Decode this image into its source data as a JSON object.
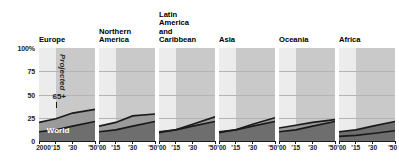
{
  "chart_data": {
    "type": "area",
    "title": "",
    "xlabel": "",
    "ylabel": "",
    "ylim": [
      0,
      100
    ],
    "xlim": [
      2000,
      2050
    ],
    "grid": true,
    "legend_position": "inline-annotations",
    "y_ticks": [
      {
        "value": 100,
        "label": "100%"
      },
      {
        "value": 75,
        "label": "75"
      },
      {
        "value": 50,
        "label": "50"
      },
      {
        "value": 25,
        "label": "25"
      },
      {
        "value": 0,
        "label": "0"
      }
    ],
    "x_ticks_first_panel": [
      "2000",
      "'15",
      "'30",
      "'50"
    ],
    "x_ticks": [
      "'00",
      "'15",
      "'30",
      "'50"
    ],
    "x_tick_values": [
      2000,
      2015,
      2030,
      2050
    ],
    "projection_start_year": 2015,
    "annotations": [
      {
        "name": "projected",
        "text": "Projected"
      },
      {
        "name": "series-65plus",
        "text": "65+"
      },
      {
        "name": "series-world",
        "text": "World"
      }
    ],
    "x": [
      2000,
      2015,
      2030,
      2050
    ],
    "panels": [
      {
        "name": "europe",
        "title": "Europe",
        "series": [
          {
            "name": "65+",
            "values": [
              20,
              24,
              30,
              34
            ]
          },
          {
            "name": "World",
            "values": [
              10,
              12,
              16,
              21
            ]
          }
        ]
      },
      {
        "name": "northern-america",
        "title": "Northern\nAmerica",
        "series": [
          {
            "name": "65+",
            "values": [
              16,
              20,
              27,
              29
            ]
          },
          {
            "name": "World",
            "values": [
              10,
              12,
              16,
              21
            ]
          }
        ]
      },
      {
        "name": "latin-america-and-caribbean",
        "title": "Latin\nAmerica\nand\nCaribbean",
        "series": [
          {
            "name": "65+",
            "values": [
              9,
              12,
              18,
              26
            ]
          },
          {
            "name": "World",
            "values": [
              10,
              12,
              16,
              21
            ]
          }
        ]
      },
      {
        "name": "asia",
        "title": "Asia",
        "series": [
          {
            "name": "65+",
            "values": [
              9,
              12,
              18,
              25
            ]
          },
          {
            "name": "World",
            "values": [
              10,
              12,
              16,
              21
            ]
          }
        ]
      },
      {
        "name": "oceania",
        "title": "Oceania",
        "series": [
          {
            "name": "65+",
            "values": [
              14,
              17,
              20,
              23
            ]
          },
          {
            "name": "World",
            "values": [
              10,
              12,
              16,
              21
            ]
          }
        ]
      },
      {
        "name": "africa",
        "title": "Africa",
        "series": [
          {
            "name": "65+",
            "values": [
              5,
              6,
              8,
              11
            ]
          },
          {
            "name": "World",
            "values": [
              10,
              12,
              16,
              21
            ]
          }
        ]
      }
    ],
    "colors": {
      "historical_background": "#ececec",
      "projected_background": "#c9c9c9",
      "gridline": "#b4b4b4",
      "band_65plus": "#9a9a9a",
      "band_world": "#6e6e6e",
      "line": "#1a1a1a",
      "axis": "#1a1a1a",
      "text": "#111111"
    }
  }
}
